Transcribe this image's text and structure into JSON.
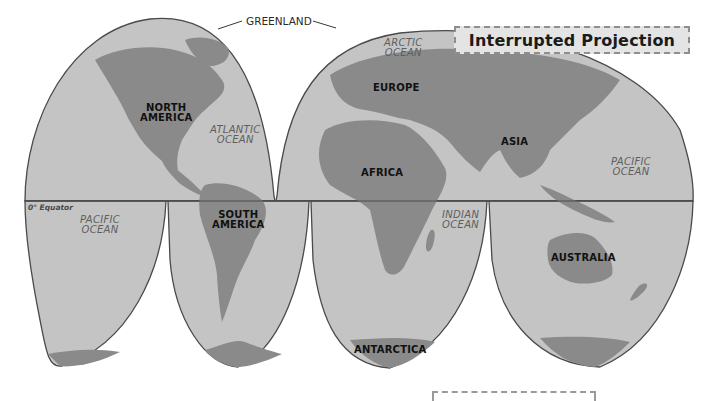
{
  "title": "Interrupted Projection",
  "colors": {
    "ocean": "#c4c4c4",
    "land": "#8a8a8a",
    "outline": "#4a4a4a",
    "background": "#ffffff",
    "title_box": "#e4e4e4"
  },
  "equator": {
    "label": "0° Equator"
  },
  "callouts": {
    "greenland": "GREENLAND"
  },
  "continents": {
    "north_america": [
      "NORTH",
      "AMERICA"
    ],
    "south_america": [
      "SOUTH",
      "AMERICA"
    ],
    "europe": "EUROPE",
    "africa": "AFRICA",
    "asia": "ASIA",
    "australia": "AUSTRALIA",
    "antarctica": "ANTARCTICA"
  },
  "oceans": {
    "arctic": [
      "ARCTIC",
      "OCEAN"
    ],
    "atlantic": [
      "ATLANTIC",
      "OCEAN"
    ],
    "pacific_west": [
      "PACIFIC",
      "OCEAN"
    ],
    "pacific_east": [
      "PACIFIC",
      "OCEAN"
    ],
    "indian": [
      "INDIAN",
      "OCEAN"
    ]
  }
}
